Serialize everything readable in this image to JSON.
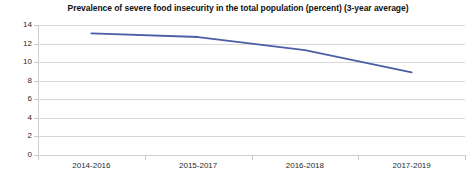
{
  "chart_data": {
    "type": "line",
    "title": "Prevalence of severe food insecurity in the total population (percent) (3-year average)",
    "xlabel": "",
    "ylabel": "",
    "categories": [
      "2014-2016",
      "2015-2017",
      "2016-2018",
      "2017-2019"
    ],
    "values": [
      13.1,
      12.7,
      11.3,
      8.9
    ],
    "series": [
      {
        "name": "Prevalence of severe food insecurity",
        "values": [
          13.1,
          12.7,
          11.3,
          8.9
        ]
      }
    ],
    "ylim": [
      0,
      14
    ],
    "ytick_labels": [
      "0",
      "2",
      "4",
      "6",
      "8",
      "10",
      "12",
      "14"
    ],
    "ytick_values": [
      0,
      2,
      4,
      6,
      8,
      10,
      12,
      14
    ],
    "grid": true,
    "legend": false,
    "legend_position": "none",
    "colors": {
      "line": "#4a5fa5",
      "grid": "#d9d9d9",
      "axis": "#d0d0d0",
      "text": "#2b2b2b",
      "title": "#111111",
      "background": "#ffffff"
    }
  }
}
